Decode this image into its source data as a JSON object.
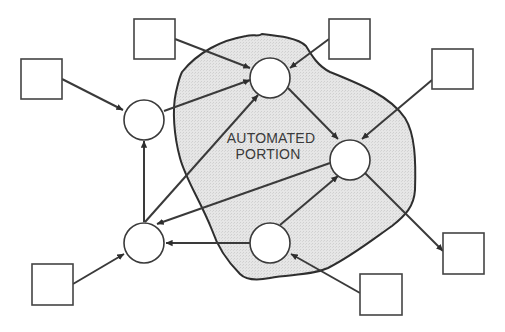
{
  "diagram": {
    "label_line1": "AUTOMATED",
    "label_line2": "PORTION",
    "colors": {
      "region_fill": "#e4e4e4",
      "stroke": "#3a3a3a",
      "background": "#ffffff"
    },
    "external_boxes": [
      {
        "id": "S1",
        "x": 21,
        "y": 59,
        "w": 41,
        "h": 40
      },
      {
        "id": "S2",
        "x": 134,
        "y": 19,
        "w": 41,
        "h": 40
      },
      {
        "id": "S3",
        "x": 329,
        "y": 19,
        "w": 41,
        "h": 40
      },
      {
        "id": "S4",
        "x": 432,
        "y": 49,
        "w": 41,
        "h": 40
      },
      {
        "id": "S5",
        "x": 443,
        "y": 233,
        "w": 41,
        "h": 41
      },
      {
        "id": "S6",
        "x": 360,
        "y": 274,
        "w": 42,
        "h": 41
      },
      {
        "id": "S7",
        "x": 32,
        "y": 264,
        "w": 41,
        "h": 41
      }
    ],
    "process_nodes": [
      {
        "id": "C1",
        "cx": 144,
        "cy": 120,
        "r": 20
      },
      {
        "id": "C2",
        "cx": 270,
        "cy": 78,
        "r": 20
      },
      {
        "id": "C3",
        "cx": 350,
        "cy": 160,
        "r": 20
      },
      {
        "id": "C4",
        "cx": 144,
        "cy": 243,
        "r": 20
      },
      {
        "id": "C5",
        "cx": 270,
        "cy": 243,
        "r": 20
      }
    ],
    "flows": [
      {
        "from": "S1",
        "to": "C1"
      },
      {
        "from": "S2",
        "to": "C2"
      },
      {
        "from": "C1",
        "to": "C2"
      },
      {
        "from": "S3",
        "to": "C2"
      },
      {
        "from": "C2",
        "to": "C3"
      },
      {
        "from": "S4",
        "to": "C3"
      },
      {
        "from": "C4",
        "to": "C1"
      },
      {
        "from": "C4",
        "to": "C2"
      },
      {
        "from": "C3",
        "to": "C4"
      },
      {
        "from": "C5",
        "to": "C4"
      },
      {
        "from": "C5",
        "to": "C3"
      },
      {
        "from": "C3",
        "to": "S5"
      },
      {
        "from": "S6",
        "to": "C5"
      },
      {
        "from": "S7",
        "to": "C4"
      }
    ]
  }
}
